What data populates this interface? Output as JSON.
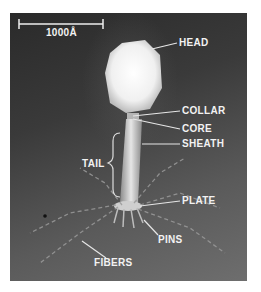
{
  "figure": {
    "scale_bar": {
      "label": "1000Å"
    },
    "labels": {
      "head": "HEAD",
      "collar": "COLLAR",
      "core": "CORE",
      "sheath": "SHEATH",
      "tail": "TAIL",
      "plate": "PLATE",
      "pins": "PINS",
      "fibers": "FIBERS"
    },
    "colors": {
      "background_dark": "#2a2a2a",
      "background_light": "#6e6e6e",
      "label_text": "#f2f2f2",
      "head_fill": "#f4f4f4"
    }
  }
}
